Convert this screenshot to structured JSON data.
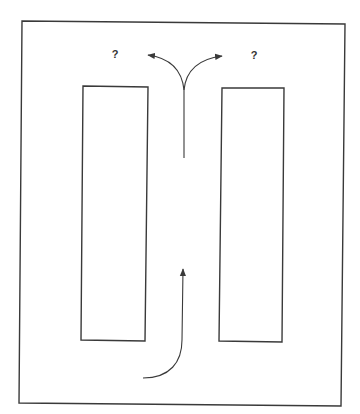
{
  "diagram": {
    "type": "maze-decision",
    "stroke_color": "#3a3a3a",
    "background": "#ffffff",
    "outer_frame": {
      "points": [
        [
          22,
          21
        ],
        [
          345,
          24
        ],
        [
          341,
          406
        ],
        [
          19,
          403
        ]
      ]
    },
    "left_block": {
      "points": [
        [
          83,
          86
        ],
        [
          148,
          87
        ],
        [
          145,
          341
        ],
        [
          81,
          340
        ]
      ]
    },
    "right_block": {
      "points": [
        [
          222,
          88
        ],
        [
          284,
          88
        ],
        [
          282,
          342
        ],
        [
          219,
          341
        ]
      ]
    },
    "entry_arrow": {
      "start": [
        143,
        378
      ],
      "end": [
        183,
        268
      ],
      "direction": "up"
    },
    "fork_arrow": {
      "stem_bottom": [
        184,
        158
      ],
      "branch_point": [
        184,
        88
      ],
      "left_tip": [
        147,
        55
      ],
      "right_tip": [
        223,
        56
      ]
    },
    "labels": [
      {
        "id": "left-question",
        "text": "?",
        "x": 115,
        "y": 54
      },
      {
        "id": "right-question",
        "text": "?",
        "x": 254,
        "y": 55
      }
    ]
  }
}
